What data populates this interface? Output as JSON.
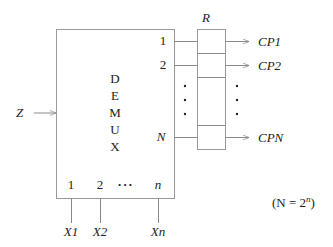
{
  "diagram": {
    "block_label_letters": [
      "D",
      "E",
      "M",
      "U",
      "X"
    ],
    "input_label": "Z",
    "register_label": "R",
    "outputs": [
      {
        "index_label": "1",
        "output_label": "CP1"
      },
      {
        "index_label": "2",
        "output_label": "CP2"
      },
      {
        "index_label": "N",
        "output_label": "CPN"
      }
    ],
    "select_indices": [
      "1",
      "2",
      "n"
    ],
    "select_ellipsis": "• • •",
    "select_inputs": [
      "X1",
      "X2",
      "Xn"
    ],
    "note": "(N = 2",
    "note_sup": "n",
    "note_close": ")",
    "colors": {
      "line": "#8a8a8a",
      "text": "#222222",
      "background": "#ffffff"
    }
  }
}
